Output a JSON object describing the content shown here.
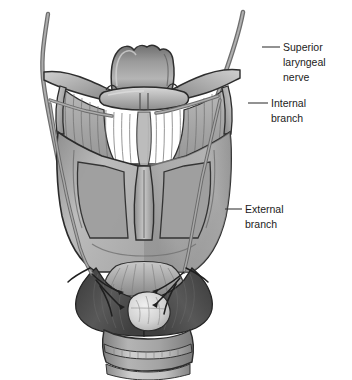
{
  "figure": {
    "background_color": "#ffffff",
    "style": "grayscale medical illustration",
    "bottom_caption": ""
  },
  "labels": [
    {
      "id": "superior-laryngeal-nerve",
      "lines": [
        "Superior",
        "laryngeal",
        "nerve"
      ],
      "line1": "Superior",
      "line2": "laryngeal",
      "line3": "nerve",
      "text_x": 283,
      "text_y": 51,
      "leader_from_x": 262,
      "leader_from_y": 47,
      "leader_to_x": 280,
      "leader_to_y": 47
    },
    {
      "id": "internal-branch",
      "lines": [
        "Internal",
        "branch"
      ],
      "line1": "Internal",
      "line2": "branch",
      "text_x": 271,
      "text_y": 107,
      "leader_from_x": 248,
      "leader_from_y": 103,
      "leader_to_x": 268,
      "leader_to_y": 103
    },
    {
      "id": "external-branch",
      "lines": [
        "External",
        "branch"
      ],
      "line1": "External",
      "line2": "branch",
      "text_x": 245,
      "text_y": 213,
      "leader_from_x": 225,
      "leader_from_y": 209,
      "leader_to_x": 242,
      "leader_to_y": 209
    }
  ],
  "anatomy": {
    "structures": [
      {
        "name": "epiglottis",
        "tone": "#8e8e8e"
      },
      {
        "name": "hyoid-bone",
        "tone": "#b9b9b9"
      },
      {
        "name": "greater-horn-of-hyoid-left",
        "tone": "#b4b4b4"
      },
      {
        "name": "greater-horn-of-hyoid-right",
        "tone": "#b4b4b4"
      },
      {
        "name": "thyrohyoid-membrane",
        "tone": "#a6a6a6"
      },
      {
        "name": "thyroid-cartilage-lamina-left",
        "tone": "#b0b0b0"
      },
      {
        "name": "thyroid-cartilage-lamina-right",
        "tone": "#b0b0b0"
      },
      {
        "name": "laryngeal-prominence",
        "tone": "#9d9d9d"
      },
      {
        "name": "superior-horn-left",
        "tone": "#a8a8a8"
      },
      {
        "name": "superior-horn-right",
        "tone": "#a8a8a8"
      },
      {
        "name": "cricothyroid-ligament",
        "tone": "#c3c3c3"
      },
      {
        "name": "cricothyroid-muscle-left",
        "tone": "#4a4a4a"
      },
      {
        "name": "cricothyroid-muscle-right",
        "tone": "#4a4a4a"
      },
      {
        "name": "cricoid-cartilage",
        "tone": "#9a9a9a"
      },
      {
        "name": "lymph-node",
        "tone": "#d6d6d6"
      },
      {
        "name": "tracheal-ring-1",
        "tone": "#a5a5a5"
      },
      {
        "name": "tracheal-ring-2",
        "tone": "#a5a5a5"
      },
      {
        "name": "trachea",
        "tone": "#9b9b9b"
      }
    ],
    "nerves": [
      {
        "name": "superior-laryngeal-nerve-trunk-right",
        "tone": "#7a7a7a"
      },
      {
        "name": "superior-laryngeal-nerve-trunk-left",
        "tone": "#7a7a7a"
      },
      {
        "name": "internal-branch-right",
        "tone": "#7a7a7a"
      },
      {
        "name": "internal-branch-left",
        "tone": "#7a7a7a"
      },
      {
        "name": "external-branch-right",
        "tone": "#7a7a7a"
      },
      {
        "name": "external-branch-left",
        "tone": "#7a7a7a"
      },
      {
        "name": "nerve-twigs-to-cricothyroid",
        "tone": "#2e2e2e"
      }
    ]
  },
  "colors": {
    "ink": "#1b1b1b",
    "leader": "#3a3a3a",
    "outline": "#2b2b2b",
    "cartilage_light": "#d2d2d2",
    "cartilage_mid": "#a9a9a9",
    "cartilage_dark": "#7d7d7d",
    "muscle_dark": "#4a4a4a",
    "nerve": "#868686",
    "background": "#ffffff"
  }
}
